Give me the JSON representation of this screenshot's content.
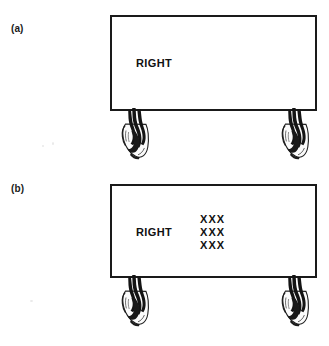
{
  "figure": {
    "background_color": "#ffffff",
    "ink_color": "#111111",
    "panels": [
      {
        "id": "a",
        "label": "(a)",
        "sign": {
          "word": "RIGHT",
          "border_color": "#1a1a1a",
          "fill_color": "#ffffff",
          "extra_text_rows": []
        },
        "hands": [
          {
            "side": "left",
            "icon": "hand-gripping-icon"
          },
          {
            "side": "right",
            "icon": "hand-gripping-icon"
          }
        ]
      },
      {
        "id": "b",
        "label": "(b)",
        "sign": {
          "word": "RIGHT",
          "border_color": "#1a1a1a",
          "fill_color": "#ffffff",
          "extra_text_rows": [
            "XXX",
            "XXX",
            "XXX"
          ]
        },
        "hands": [
          {
            "side": "left",
            "icon": "hand-gripping-icon"
          },
          {
            "side": "right",
            "icon": "hand-gripping-icon"
          }
        ]
      }
    ]
  }
}
